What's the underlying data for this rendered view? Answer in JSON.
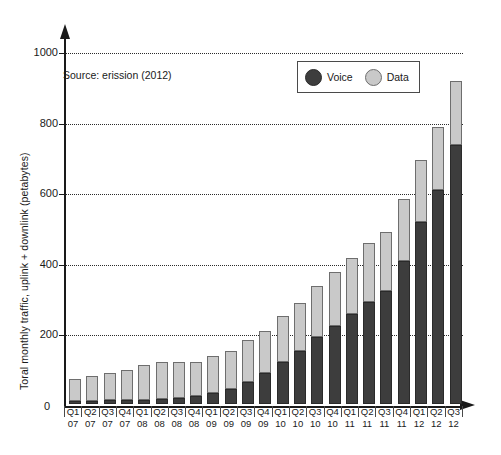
{
  "chart_data": {
    "type": "bar",
    "stacked": true,
    "title": "",
    "subtitle": "",
    "source_note": "Source: erission (2012)",
    "xlabel": "",
    "ylabel": "Toral monthly traffic, uplink + downlink (petabytes)",
    "ylim": [
      0,
      1000
    ],
    "yticks": [
      0,
      200,
      400,
      600,
      800,
      1000
    ],
    "ytick_labels": [
      "0",
      "200",
      "400",
      "600",
      "800",
      "1000"
    ],
    "grid": "horizontal-dotted",
    "legend_position": "top-right",
    "categories": [
      "Q1 07",
      "Q2 07",
      "Q3 07",
      "Q4 07",
      "Q1 08",
      "Q2 08",
      "Q3 08",
      "Q4 08",
      "Q1 09",
      "Q2 09",
      "Q3 09",
      "Q4 09",
      "Q1 10",
      "Q2 10",
      "Q3 10",
      "Q4 10",
      "Q1 11",
      "Q2 11",
      "Q3 11",
      "Q4 11",
      "Q1 12",
      "Q2 12",
      "Q3 12"
    ],
    "quarters": [
      "Q1",
      "Q2",
      "Q3",
      "Q4",
      "Q1",
      "Q2",
      "Q3",
      "Q4",
      "Q1",
      "Q2",
      "Q3",
      "Q4",
      "Q1",
      "Q2",
      "Q3",
      "Q4",
      "Q1",
      "Q2",
      "Q3",
      "Q4",
      "Q1",
      "Q2",
      "Q3"
    ],
    "years": [
      "07",
      "07",
      "07",
      "07",
      "08",
      "08",
      "08",
      "08",
      "09",
      "09",
      "09",
      "09",
      "10",
      "10",
      "10",
      "10",
      "11",
      "11",
      "11",
      "11",
      "12",
      "12",
      "12"
    ],
    "series": [
      {
        "name": "Voice",
        "color": "#3d3d3d",
        "values": [
          8,
          8,
          10,
          10,
          12,
          14,
          18,
          22,
          30,
          42,
          62,
          88,
          118,
          150,
          190,
          222,
          255,
          290,
          320,
          405,
          515,
          605,
          735
        ]
      },
      {
        "name": "Data",
        "color": "#c9c9c9",
        "values": [
          62,
          72,
          78,
          85,
          98,
          106,
          102,
          98,
          105,
          108,
          118,
          120,
          130,
          135,
          145,
          152,
          160,
          165,
          168,
          175,
          175,
          180,
          180
        ]
      }
    ],
    "totals": [
      70,
      80,
      88,
      95,
      110,
      120,
      120,
      120,
      135,
      150,
      180,
      208,
      248,
      285,
      335,
      374,
      415,
      455,
      488,
      580,
      690,
      785,
      915
    ]
  },
  "legend": {
    "items": [
      {
        "label": "Voice",
        "swatch": "voice-circle-icon"
      },
      {
        "label": "Data",
        "swatch": "data-circle-icon"
      }
    ]
  }
}
